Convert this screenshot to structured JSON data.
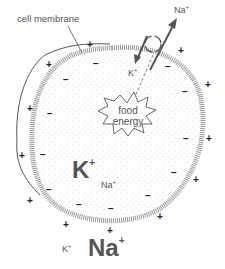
{
  "diagram": {
    "title_label": "cell membrane",
    "pump": {
      "out_ion": "Na",
      "out_ion_charge": "+",
      "in_ion": "K",
      "in_ion_charge": "+"
    },
    "energy_source": {
      "line1": "food",
      "line2": "energy"
    },
    "inside": {
      "major_ion": "K",
      "major_charge": "+",
      "minor_ion": "Na",
      "minor_charge": "+"
    },
    "outside": {
      "major_ion": "Na",
      "major_charge": "+",
      "minor_ion": "K",
      "minor_charge": "+"
    },
    "charges": {
      "outside_sign": "+",
      "inside_sign": "−"
    },
    "colors": {
      "membrane": "#8a8a8a",
      "stipple": "#b0b0b0",
      "text": "#555555",
      "line": "#444444"
    }
  }
}
